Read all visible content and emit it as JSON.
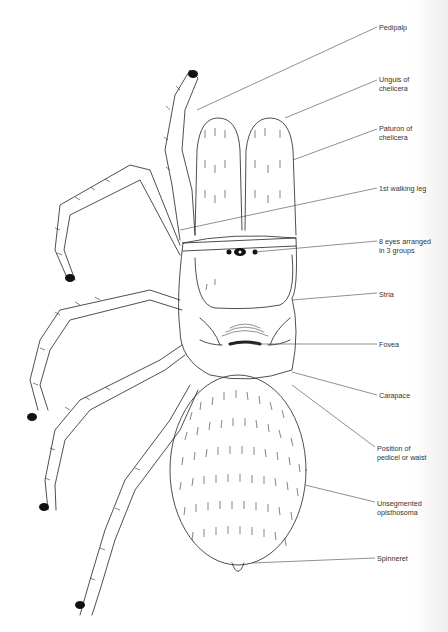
{
  "diagram": {
    "colors": {
      "ink": "#222222",
      "background": "#ffffff",
      "label": "#333333"
    },
    "labels": [
      {
        "id": "pedipalp",
        "lines": [
          "Pedipalp"
        ],
        "x": 379,
        "y": 23,
        "anchor": [
          197,
          110
        ]
      },
      {
        "id": "unguis",
        "lines": [
          "Unguis of",
          "chelicera"
        ],
        "x": 379,
        "y": 75,
        "anchor": [
          285,
          118
        ]
      },
      {
        "id": "paturon",
        "lines": [
          "Paturon of",
          "chelicera"
        ],
        "x": 379,
        "y": 124,
        "anchor": [
          293,
          160
        ]
      },
      {
        "id": "walking-leg-1",
        "lines": [
          "1st walking leg"
        ],
        "x": 379,
        "y": 184,
        "anchor": [
          180,
          230
        ]
      },
      {
        "id": "eyes",
        "lines": [
          "8 eyes arranged",
          "in 3 groups"
        ],
        "x": 379,
        "y": 237,
        "anchor": [
          255,
          252
        ]
      },
      {
        "id": "stria",
        "lines": [
          "Stria"
        ],
        "x": 379,
        "y": 290,
        "anchor": [
          292,
          300
        ]
      },
      {
        "id": "fovea",
        "lines": [
          "Fovea"
        ],
        "x": 379,
        "y": 341,
        "anchor": [
          252,
          344
        ]
      },
      {
        "id": "carapace",
        "lines": [
          "Carapace"
        ],
        "x": 379,
        "y": 392,
        "anchor": [
          292,
          372
        ]
      },
      {
        "id": "pedicel",
        "lines": [
          "Position of",
          "pedicel or waist"
        ],
        "x": 377,
        "y": 444,
        "anchor": [
          292,
          385
        ]
      },
      {
        "id": "opisthosoma",
        "lines": [
          "Unsegmented",
          "opisthosoma"
        ],
        "x": 377,
        "y": 499,
        "anchor": [
          305,
          485
        ]
      },
      {
        "id": "spinneret",
        "lines": [
          "Spinneret"
        ],
        "x": 377,
        "y": 555,
        "anchor": [
          252,
          563
        ]
      }
    ]
  }
}
